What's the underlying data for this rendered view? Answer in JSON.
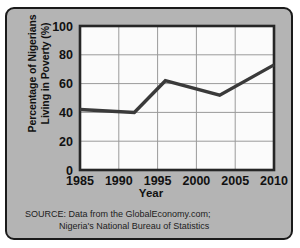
{
  "chart_data": {
    "type": "line",
    "title": "",
    "xlabel": "Year",
    "ylabel": "Percentage of Nigerians Living in Poverty (%)",
    "ylabel_line1": "Percentage of Nigerians",
    "ylabel_line2": "Living in Poverty (%)",
    "xlim": [
      1985,
      2010
    ],
    "ylim": [
      0,
      100
    ],
    "xticks": [
      1985,
      1990,
      1995,
      2000,
      2005,
      2010
    ],
    "yticks": [
      0,
      20,
      40,
      60,
      80,
      100
    ],
    "grid": true,
    "legend": "none",
    "series": [
      {
        "name": "Percentage of Nigerians Living in Poverty",
        "color": "#3a3a3a",
        "x": [
          1985,
          1992,
          1996,
          2003,
          2010
        ],
        "values": [
          42,
          40,
          62,
          52,
          73
        ]
      }
    ]
  },
  "source": {
    "line1": "SOURCE: Data from the GlobalEconomy.com;",
    "line2": "Nigeria's National Bureau of Statistics"
  },
  "style": {
    "panel_background": "#b4b4b4",
    "panel_border": "#1a1a1a",
    "plot_background": "#fbfbfb",
    "axis_color": "#262626",
    "grid_color": "#9a9a9a",
    "line_color": "#3a3a3a",
    "text_color": "#111111"
  }
}
